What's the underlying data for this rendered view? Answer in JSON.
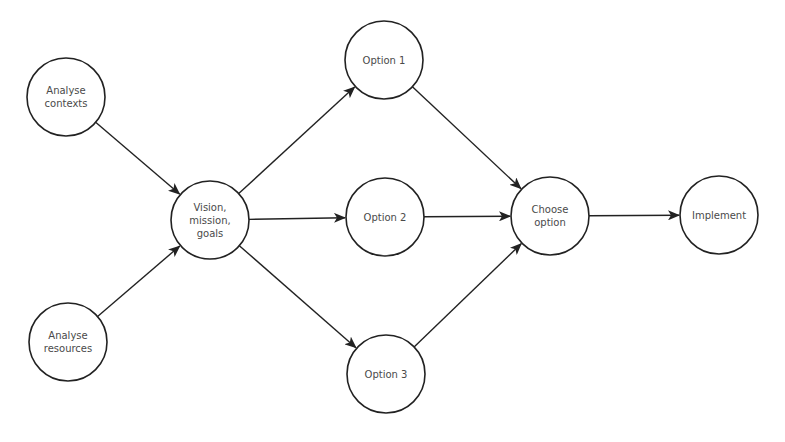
{
  "diagram": {
    "type": "flow",
    "nodes": [
      {
        "id": "analyse-contexts",
        "lines": [
          "Analyse",
          "contexts"
        ]
      },
      {
        "id": "analyse-resources",
        "lines": [
          "Analyse",
          "resources"
        ]
      },
      {
        "id": "vision",
        "lines": [
          "Vision,",
          "mission,",
          "goals"
        ]
      },
      {
        "id": "option-1",
        "lines": [
          "Option 1"
        ]
      },
      {
        "id": "option-2",
        "lines": [
          "Option 2"
        ]
      },
      {
        "id": "option-3",
        "lines": [
          "Option 3"
        ]
      },
      {
        "id": "choose-option",
        "lines": [
          "Choose",
          "option"
        ]
      },
      {
        "id": "implement",
        "lines": [
          "Implement"
        ]
      }
    ],
    "edges": [
      {
        "from": "analyse-contexts",
        "to": "vision"
      },
      {
        "from": "analyse-resources",
        "to": "vision"
      },
      {
        "from": "vision",
        "to": "option-1"
      },
      {
        "from": "vision",
        "to": "option-2"
      },
      {
        "from": "vision",
        "to": "option-3"
      },
      {
        "from": "option-1",
        "to": "choose-option"
      },
      {
        "from": "option-2",
        "to": "choose-option"
      },
      {
        "from": "option-3",
        "to": "choose-option"
      },
      {
        "from": "choose-option",
        "to": "implement"
      }
    ]
  }
}
